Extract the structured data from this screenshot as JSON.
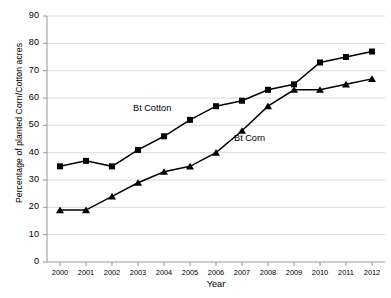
{
  "chart_data": {
    "type": "line",
    "title": "",
    "xlabel": "Year",
    "ylabel": "Percentage of planted Corn/Cotton acres",
    "categories": [
      "2000",
      "2001",
      "2002",
      "2003",
      "2004",
      "2005",
      "2006",
      "2007",
      "2008",
      "2009",
      "2010",
      "2011",
      "2012"
    ],
    "x": [
      2000,
      2001,
      2002,
      2003,
      2004,
      2005,
      2006,
      2007,
      2008,
      2009,
      2010,
      2011,
      2012
    ],
    "ylim": [
      0,
      90
    ],
    "ytick_labels": [
      "0",
      "10",
      "20",
      "30",
      "40",
      "50",
      "60",
      "70",
      "80",
      "90"
    ],
    "ytick_values": [
      0,
      10,
      20,
      30,
      40,
      50,
      60,
      70,
      80,
      90
    ],
    "grid": "horizontal",
    "legend_position": "inline-annotation",
    "series": [
      {
        "name": "Bt Cotton",
        "marker": "square",
        "color": "#000000",
        "values": [
          35,
          37,
          35,
          41,
          46,
          52,
          57,
          59,
          63,
          65,
          73,
          75,
          77
        ]
      },
      {
        "name": "Bt Corn",
        "marker": "triangle",
        "color": "#000000",
        "values": [
          19,
          19,
          24,
          29,
          33,
          35,
          40,
          48,
          57,
          63,
          63,
          65,
          67
        ]
      }
    ],
    "annotations": [
      {
        "text": "Bt Cotton",
        "target_year": 2006,
        "target_value": 57
      },
      {
        "text": "Bt Corn",
        "target_year": 2007,
        "target_value": 48
      }
    ]
  }
}
